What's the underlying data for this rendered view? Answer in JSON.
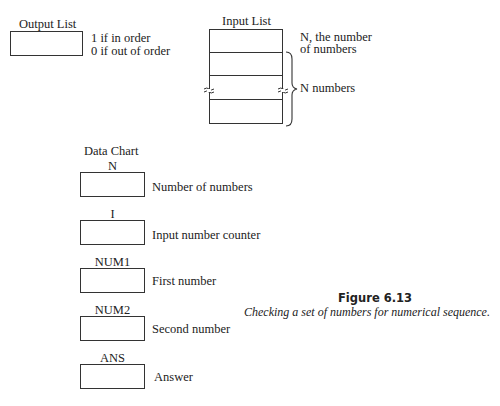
{
  "output_list": {
    "title": "Output List",
    "notes": [
      "1 if in order",
      "0 if out of order"
    ]
  },
  "input_list": {
    "title": "Input List",
    "first_row_note": [
      "N, the number",
      "of numbers"
    ],
    "brace_note": "N numbers",
    "row_count": 4
  },
  "data_chart": {
    "title": "Data Chart",
    "items": [
      {
        "name": "N",
        "description": "Number of numbers"
      },
      {
        "name": "I",
        "description": "Input number counter"
      },
      {
        "name": "NUM1",
        "description": "First number"
      },
      {
        "name": "NUM2",
        "description": "Second number"
      },
      {
        "name": "ANS",
        "description": "Answer"
      }
    ]
  },
  "figure": {
    "number": "Figure 6.13",
    "caption": "Checking a set of numbers for numerical sequence."
  }
}
